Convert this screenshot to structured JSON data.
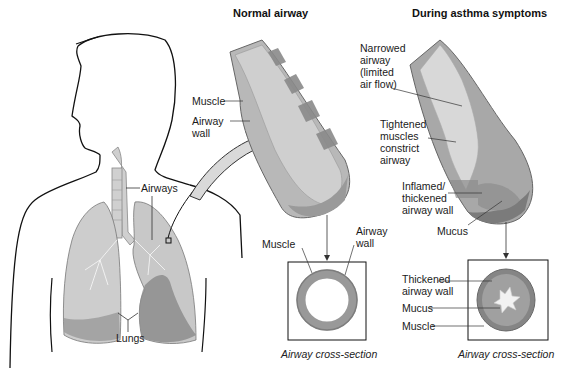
{
  "titles": {
    "normal": "Normal airway",
    "asthma": "During asthma symptoms"
  },
  "body_labels": {
    "airways": "Airways",
    "lungs": "Lungs"
  },
  "normal_airway": {
    "muscle": "Muscle",
    "airway_wall": "Airway\nwall",
    "cross_section": {
      "muscle": "Muscle",
      "airway_wall": "Airway\nwall",
      "caption": "Airway cross-section"
    }
  },
  "asthma_airway": {
    "narrowed": "Narrowed\nairway\n(limited\nair flow)",
    "tightened": "Tightened\nmuscles\nconstrict\nairway",
    "inflamed": "Inflamed/\nthickened\nairway wall",
    "mucus": "Mucus",
    "cross_section": {
      "thickened": "Thickened\nairway wall",
      "mucus": "Mucus",
      "muscle": "Muscle",
      "caption": "Airway cross-section"
    }
  },
  "colors": {
    "outline": "#111111",
    "lung_fill": "#c9c9c9",
    "lung_dark": "#8f8f8f",
    "tube_light": "#d6d6d6",
    "tube_mid": "#a9a9a9",
    "tube_dark": "#7a7a7a"
  }
}
